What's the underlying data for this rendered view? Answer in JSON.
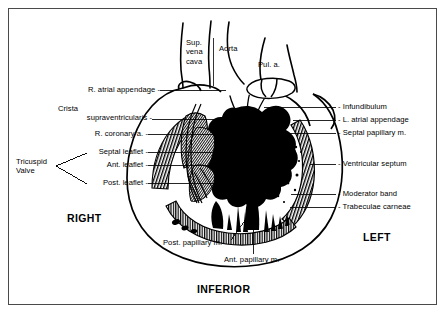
{
  "figure": {
    "type": "anatomical-diagram",
    "background_color": "#ffffff",
    "frame_color": "#4a4a4a",
    "ink_color": "#000000"
  },
  "orientation_labels": {
    "right": "RIGHT",
    "left": "LEFT",
    "inferior": "INFERIOR"
  },
  "top_labels": [
    {
      "id": "sup-vena-cava",
      "text_lines": [
        "Sup.",
        "vena",
        "cava"
      ],
      "text": "Sup. vena cava"
    },
    {
      "id": "aorta",
      "text_lines": [
        "Aorta"
      ],
      "text": "Aorta"
    },
    {
      "id": "pulmonary-artery",
      "text_lines": [
        "Pul. a."
      ],
      "text": "Pul. a."
    }
  ],
  "left_labels": [
    {
      "id": "r-atrial-appendage",
      "text": "R. atrial appendage -"
    },
    {
      "id": "crista-supraventricularis",
      "line1": "Crista",
      "line2": "supraventricularis -",
      "text": "Crista supraventricularis"
    },
    {
      "id": "r-coronary-a",
      "text": "R. coronary a. -"
    },
    {
      "id": "septal-leaflet",
      "text": "Septal leaflet -"
    },
    {
      "id": "ant-leaflet",
      "text": "Ant. leaflet -"
    },
    {
      "id": "post-leaflet",
      "text": "Post. leaflet -"
    }
  ],
  "bracket_label": {
    "id": "tricuspid-valve",
    "line1": "Tricuspid",
    "line2": "Valve",
    "text": "Tricuspid Valve"
  },
  "right_labels": [
    {
      "id": "infundibulum",
      "text": "- Infundibulum"
    },
    {
      "id": "l-atrial-appendage",
      "text": "- L. atrial appendage"
    },
    {
      "id": "septal-papillary-m",
      "text": "- Septal papillary m."
    },
    {
      "id": "ventricular-septum",
      "text": "- Ventricular septum"
    },
    {
      "id": "moderator-band",
      "text": "- Moderator band"
    },
    {
      "id": "trabeculae-carneae",
      "text": "- Trabeculae carneae"
    }
  ],
  "bottom_labels": [
    {
      "id": "post-papillary-m",
      "text": "Post. papillary m."
    },
    {
      "id": "ant-papillary-m",
      "text": "Ant. papillary m."
    }
  ]
}
